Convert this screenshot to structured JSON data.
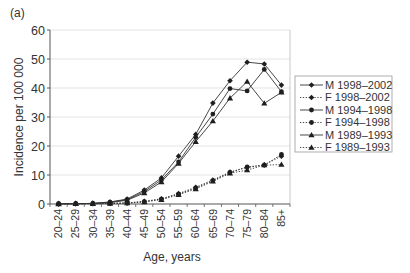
{
  "panel_label": "(a)",
  "chart_data": {
    "type": "line",
    "title": "",
    "panel_label": "(a)",
    "xlabel": "Age, years",
    "ylabel": "Incidence per 100 000",
    "ylim": [
      0,
      60
    ],
    "yticks": [
      "0",
      "10",
      "20",
      "30",
      "40",
      "50",
      "60"
    ],
    "ytick_values": [
      0,
      10,
      20,
      30,
      40,
      50,
      60
    ],
    "grid": "horizontal",
    "legend_position": "right, outside plot",
    "categories": [
      "20–24",
      "25–29",
      "30–34",
      "35–39",
      "40–44",
      "45–49",
      "50–54",
      "55–59",
      "60–64",
      "65–69",
      "70–74",
      "75–79",
      "80–84",
      "85+"
    ],
    "series": [
      {
        "name": "M 1998–2002",
        "marker": "diamond",
        "linestyle": "solid",
        "values": [
          0.1,
          0.1,
          0.2,
          0.7,
          1.7,
          4.8,
          9.0,
          16.5,
          24.0,
          34.8,
          42.5,
          48.9,
          48.3,
          41.0
        ]
      },
      {
        "name": "F 1998–2002",
        "marker": "diamond",
        "linestyle": "dotted",
        "values": [
          0.0,
          0.1,
          0.1,
          0.2,
          0.4,
          0.9,
          1.8,
          3.6,
          5.8,
          8.3,
          11.0,
          12.6,
          13.5,
          16.5
        ]
      },
      {
        "name": "M 1994–1998",
        "marker": "circle",
        "linestyle": "solid",
        "values": [
          0.1,
          0.1,
          0.2,
          0.6,
          1.5,
          4.3,
          8.3,
          14.5,
          23.0,
          31.0,
          39.8,
          39.0,
          46.4,
          38.7
        ]
      },
      {
        "name": "F 1994–1998",
        "marker": "circle",
        "linestyle": "dotted",
        "values": [
          0.0,
          0.1,
          0.1,
          0.2,
          0.3,
          0.8,
          1.7,
          3.4,
          5.5,
          8.0,
          10.9,
          12.8,
          13.4,
          17.1
        ]
      },
      {
        "name": "M 1989–1993",
        "marker": "triangle",
        "linestyle": "solid",
        "values": [
          0.1,
          0.1,
          0.2,
          0.5,
          1.3,
          3.8,
          7.6,
          14.0,
          21.5,
          28.6,
          36.5,
          42.2,
          34.7,
          38.5
        ]
      },
      {
        "name": "F 1989–1993",
        "marker": "triangle",
        "linestyle": "dotted",
        "values": [
          0.0,
          0.1,
          0.1,
          0.2,
          0.3,
          0.7,
          1.5,
          3.2,
          5.2,
          7.8,
          10.6,
          11.7,
          13.4,
          13.6
        ]
      }
    ],
    "colors": {
      "line": "#333333",
      "marker": "#1f1f1f",
      "grid": "#dddddd",
      "axis": "#555555",
      "text": "#333333",
      "legend_border": "#999999"
    }
  }
}
